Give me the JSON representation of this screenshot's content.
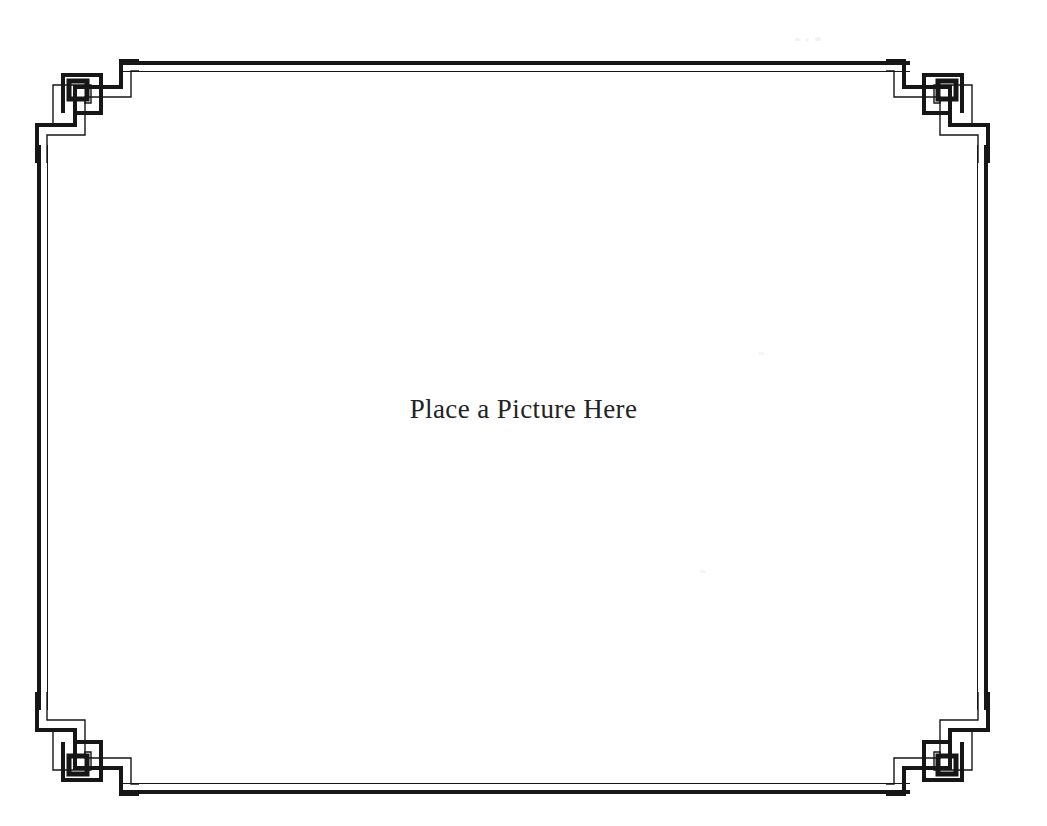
{
  "document": {
    "title": "Place a Picture Here",
    "background_color": "#ffffff",
    "ink_color": "#161616"
  },
  "frame": {
    "style_name": "greek-key-double-rule",
    "outer_rule_label": "thick outer rule",
    "inner_rule_label": "thin inner rule",
    "corners": [
      {
        "name": "top-left-ornament",
        "label": "Greek key spiral corner"
      },
      {
        "name": "top-right-ornament",
        "label": "Greek key spiral corner"
      },
      {
        "name": "bottom-left-ornament",
        "label": "Greek key spiral corner"
      },
      {
        "name": "bottom-right-ornament",
        "label": "Greek key spiral corner"
      }
    ]
  },
  "placeholder": {
    "caption": "Place a Picture Here",
    "text_color": "#232323"
  }
}
